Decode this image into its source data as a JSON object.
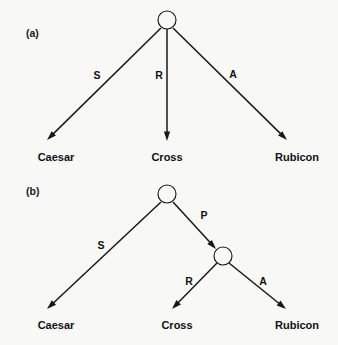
{
  "figure": {
    "background_color": "#f8f8f6",
    "ink_color": "#111113",
    "width": 338,
    "height": 345
  },
  "panels": [
    {
      "id": "a",
      "label": "(a)",
      "label_x": 26,
      "label_y": 37,
      "root": {
        "name": "root-node-a",
        "cx": 167,
        "cy": 20,
        "r": 9
      },
      "edges": [
        {
          "name": "edge-s-a",
          "label": "S",
          "label_x": 97,
          "label_y": 79,
          "x1": 161,
          "y1": 28,
          "x2": 47,
          "y2": 140
        },
        {
          "name": "edge-r-a",
          "label": "R",
          "label_x": 159,
          "label_y": 79,
          "x1": 167,
          "y1": 29,
          "x2": 167,
          "y2": 141
        },
        {
          "name": "edge-a-a",
          "label": "A",
          "label_x": 233,
          "label_y": 78,
          "x1": 173,
          "y1": 28,
          "x2": 287,
          "y2": 140
        }
      ],
      "leaves": [
        {
          "name": "leaf-caesar-a",
          "label": "Caesar",
          "x": 56,
          "y": 161
        },
        {
          "name": "leaf-cross-a",
          "label": "Cross",
          "x": 167,
          "y": 161
        },
        {
          "name": "leaf-rubicon-a",
          "label": "Rubicon",
          "x": 297,
          "y": 161
        }
      ]
    },
    {
      "id": "b",
      "label": "(b)",
      "label_x": 26,
      "label_y": 195,
      "root": {
        "name": "root-node-b",
        "cx": 167,
        "cy": 194,
        "r": 9
      },
      "inner": {
        "name": "inner-node-b",
        "cx": 223,
        "cy": 256,
        "r": 9
      },
      "edges": [
        {
          "name": "edge-s-b",
          "label": "S",
          "label_x": 101,
          "label_y": 249,
          "x1": 161,
          "y1": 202,
          "x2": 47,
          "y2": 309
        },
        {
          "name": "edge-p-b",
          "label": "P",
          "label_x": 204,
          "label_y": 219,
          "x1": 173,
          "y1": 202,
          "x2": 216,
          "y2": 249
        },
        {
          "name": "edge-r-b",
          "label": "R",
          "label_x": 189,
          "label_y": 285,
          "x1": 217,
          "y1": 263,
          "x2": 172,
          "y2": 309
        },
        {
          "name": "edge-a-b",
          "label": "A",
          "label_x": 263,
          "label_y": 285,
          "x1": 229,
          "y1": 263,
          "x2": 286,
          "y2": 309
        }
      ],
      "leaves": [
        {
          "name": "leaf-caesar-b",
          "label": "Caesar",
          "x": 56,
          "y": 329
        },
        {
          "name": "leaf-cross-b",
          "label": "Cross",
          "x": 177,
          "y": 329
        },
        {
          "name": "leaf-rubicon-b",
          "label": "Rubicon",
          "x": 297,
          "y": 329
        }
      ]
    }
  ]
}
